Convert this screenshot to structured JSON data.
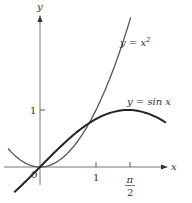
{
  "chart_data": {
    "type": "line",
    "title": "",
    "xlabel": "x",
    "ylabel": "y",
    "origin_label": "0",
    "x_ticks": [
      {
        "value": 1,
        "label": "1"
      },
      {
        "value": 1.5708,
        "label_num": "π",
        "label_den": "2"
      }
    ],
    "y_ticks": [
      {
        "value": 1,
        "label": "1"
      }
    ],
    "xlim": [
      -0.57,
      2.3
    ],
    "ylim": [
      -0.4,
      2.7
    ],
    "grid": false,
    "series": [
      {
        "name": "y = x^2",
        "label_main": "y  =  x",
        "label_sup": "2",
        "function": "x^2",
        "x_range": [
          -0.57,
          1.62
        ],
        "color": "#555555"
      },
      {
        "name": "y = sin x",
        "label": "y  =  sin x",
        "function": "sin(x)",
        "x_range": [
          -0.46,
          2.25
        ],
        "color": "#222222"
      }
    ]
  }
}
